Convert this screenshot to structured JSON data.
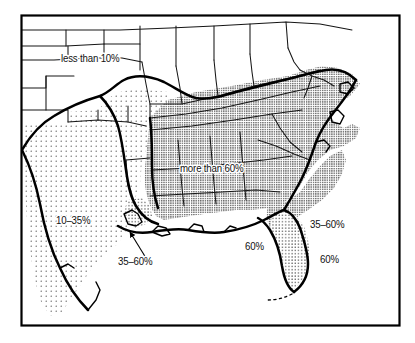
{
  "map": {
    "title": "Southeastern United States thematic percentage map",
    "frame": {
      "stroke_color": "#000000",
      "fill_color": "#ffffff",
      "x": 21,
      "y": 15,
      "width": 379,
      "height": 311
    },
    "colors": {
      "ink": "#000000",
      "background": "#ffffff",
      "state_line": "#1a1a1a",
      "zone_boundary": "#000000",
      "stipple_light": "#555555",
      "stipple_dark": "#333333"
    },
    "legend_zones": [
      {
        "key": "lt10",
        "label": "less than 10%",
        "fill": "none",
        "description": "unshaded northern interior"
      },
      {
        "key": "10to35",
        "label": "10–35%",
        "fill": "sparse-dots",
        "description": "sparse stipple over Texas and the western plains"
      },
      {
        "key": "35to60",
        "label": "35–60%",
        "fill": "medium-dots",
        "description": "coastal and delta transition band"
      },
      {
        "key": "gt60",
        "label": "more than 60%",
        "fill": "dense-dots",
        "description": "dense stipple over the Deep South and Atlantic coastal plain"
      }
    ],
    "labels": [
      {
        "id": "less-than-10",
        "text": "less than 10%",
        "x": 61,
        "y": 62,
        "zone": "lt10",
        "leader": false
      },
      {
        "id": "more-than-60",
        "text": "more than 60%",
        "x": 180,
        "y": 172,
        "zone": "gt60",
        "leader": false
      },
      {
        "id": "ten-to-thirtyfive",
        "text": "10–35%",
        "x": 56,
        "y": 224,
        "zone": "10to35",
        "leader": false
      },
      {
        "id": "thirtyfive-to-sixty-delta",
        "text": "35–60%",
        "x": 118,
        "y": 265,
        "zone": "35to60",
        "leader": true
      },
      {
        "id": "thirtyfive-to-sixty-atlantic",
        "text": "35–60%",
        "x": 310,
        "y": 228,
        "zone": "35to60",
        "leader": false
      },
      {
        "id": "sixty-gulf",
        "text": "60%",
        "x": 245,
        "y": 250,
        "zone": "gt60",
        "leader": false
      },
      {
        "id": "sixty-atlantic",
        "text": "60%",
        "x": 320,
        "y": 263,
        "zone": "gt60",
        "leader": false
      }
    ],
    "leader_line": {
      "id": "delta-leader",
      "from_x": 146,
      "from_y": 258,
      "to_x": 128,
      "to_y": 229,
      "arrow": true
    }
  }
}
